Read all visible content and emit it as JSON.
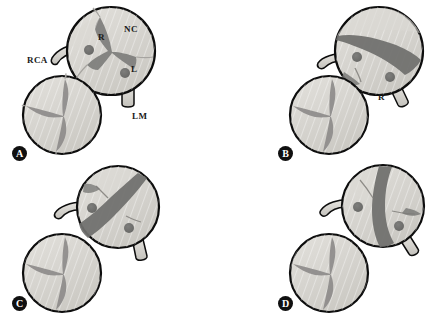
{
  "figure": {
    "colors": {
      "cusp_fill": "#d4d2cd",
      "cusp_fill_light": "#dedcd7",
      "orifice_dark": "#6e6e6e",
      "commissure_dark": "#8a8a88",
      "ostium_dot": "#6d6d6b",
      "outline": "#0d0d0d",
      "vessel_fill": "#d8d6d1",
      "marker_bg": "#101010",
      "marker_text": "#ffffff",
      "label_text": "#1a1a1a",
      "background": "#ffffff"
    }
  },
  "panels": [
    {
      "id": "A",
      "letter": "A",
      "type": "tricuspid",
      "orifice": "triradiate",
      "labels": [
        {
          "name": "rca-label",
          "text": "RCA",
          "x": 27,
          "y": 56
        },
        {
          "name": "r-cusp-label",
          "text": "R",
          "x": 98,
          "y": 33
        },
        {
          "name": "nc-cusp-label",
          "text": "NC",
          "x": 124,
          "y": 25
        },
        {
          "name": "l-cusp-label",
          "text": "L",
          "x": 131,
          "y": 65
        },
        {
          "name": "lm-label",
          "text": "LM",
          "x": 132,
          "y": 112
        }
      ],
      "ostia": [
        {
          "name": "right-coronary-ostium",
          "cx": 89,
          "cy": 50,
          "r": 5
        },
        {
          "name": "left-coronary-ostium",
          "cx": 125,
          "cy": 73,
          "r": 5
        }
      ]
    },
    {
      "id": "B",
      "letter": "B",
      "type": "bicuspid",
      "orifice": "horizontal-slit",
      "labels": [
        {
          "name": "r-cusp-label",
          "text": "R",
          "x": 378,
          "y": 93
        }
      ],
      "ostia": [
        {
          "name": "right-coronary-ostium",
          "cx": 357,
          "cy": 57,
          "r": 5
        },
        {
          "name": "left-coronary-ostium",
          "cx": 390,
          "cy": 77,
          "r": 5
        }
      ]
    },
    {
      "id": "C",
      "letter": "C",
      "type": "bicuspid",
      "orifice": "oblique-slit",
      "labels": [],
      "ostia": [
        {
          "name": "right-coronary-ostium",
          "cx": 92,
          "cy": 208,
          "r": 5
        },
        {
          "name": "left-coronary-ostium",
          "cx": 129,
          "cy": 228,
          "r": 5
        }
      ]
    },
    {
      "id": "D",
      "letter": "D",
      "type": "bicuspid",
      "orifice": "vertical-slit",
      "labels": [],
      "ostia": [
        {
          "name": "right-coronary-ostium",
          "cx": 358,
          "cy": 207,
          "r": 5
        },
        {
          "name": "left-coronary-ostium",
          "cx": 399,
          "cy": 226,
          "r": 5
        }
      ]
    }
  ],
  "panel_markers": [
    {
      "name": "panel-marker-a",
      "letter": "A",
      "x": 12,
      "y": 146
    },
    {
      "name": "panel-marker-b",
      "letter": "B",
      "x": 278,
      "y": 146
    },
    {
      "name": "panel-marker-c",
      "letter": "C",
      "x": 12,
      "y": 296
    },
    {
      "name": "panel-marker-d",
      "letter": "D",
      "x": 278,
      "y": 296
    }
  ]
}
